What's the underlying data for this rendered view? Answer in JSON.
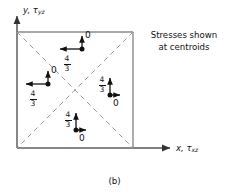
{
  "figure": {
    "caption": "(b)",
    "note": "Stresses shown at centroids",
    "note_line1": "Stresses shown",
    "note_line2": "at centroids"
  },
  "axes": {
    "y": {
      "var": "y",
      "stress_symbol": "τ",
      "stress_sub": "yz",
      "label": "y, τyz"
    },
    "x": {
      "var": "x",
      "stress_symbol": "τ",
      "stress_sub": "xz",
      "label": "x, τxz"
    }
  },
  "colors": {
    "line": "#111111",
    "square_border": "#8a8a8a",
    "diagonal": "#9a9a9a",
    "background": "#ffffff"
  },
  "square": {
    "x": 17,
    "y": 32,
    "width": 116,
    "height": 116
  },
  "centroids": [
    {
      "id": "top",
      "cx": 82,
      "cy": 49,
      "horizontal": {
        "direction": "left",
        "value": "4/3",
        "numerator": "4",
        "denominator": "3"
      },
      "vertical": {
        "direction": "up",
        "value": "0"
      }
    },
    {
      "id": "left",
      "cx": 48,
      "cy": 84,
      "horizontal": {
        "direction": "left",
        "value": "4/3",
        "numerator": "4",
        "denominator": "3"
      },
      "vertical": {
        "direction": "up",
        "value": "0"
      }
    },
    {
      "id": "right",
      "cx": 110,
      "cy": 95,
      "horizontal": {
        "direction": "right",
        "value": "0"
      },
      "vertical": {
        "direction": "up",
        "value": "4/3",
        "numerator": "4",
        "denominator": "3"
      }
    },
    {
      "id": "bottom",
      "cx": 76,
      "cy": 130,
      "horizontal": {
        "direction": "right",
        "value": "0"
      },
      "vertical": {
        "direction": "up",
        "value": "4/3",
        "numerator": "4",
        "denominator": "3"
      }
    }
  ],
  "labels": {
    "frac_num": "4",
    "frac_den": "3",
    "zero": "0"
  }
}
